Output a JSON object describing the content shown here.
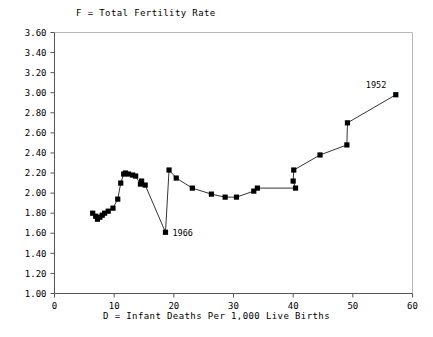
{
  "chart_data": {
    "type": "line",
    "title": "",
    "header_label": "F = Total Fertility Rate",
    "xlabel": "D = Infant Deaths Per 1,000 Live Births",
    "ylabel": "",
    "xlim": [
      0,
      60
    ],
    "ylim": [
      1.0,
      3.6
    ],
    "xticks": [
      0,
      10,
      20,
      30,
      40,
      50,
      60
    ],
    "xtick_labels": [
      "0",
      "10",
      "20",
      "30",
      "40",
      "50",
      "60"
    ],
    "yticks": [
      1.0,
      1.2,
      1.4,
      1.6,
      1.8,
      2.0,
      2.2,
      2.4,
      2.6,
      2.8,
      3.0,
      3.2,
      3.4,
      3.6
    ],
    "ytick_labels": [
      "1.00",
      "1.20",
      "1.40",
      "1.60",
      "1.80",
      "2.00",
      "2.20",
      "2.40",
      "2.60",
      "2.80",
      "3.00",
      "3.20",
      "3.40",
      "3.60"
    ],
    "grid": false,
    "legend": "none",
    "marker": "square",
    "marker_color": "#000000",
    "line_color": "#000000",
    "series": [
      {
        "name": "D vs F trajectory",
        "points": [
          [
            57.2,
            2.98
          ],
          [
            49.1,
            2.7
          ],
          [
            49.0,
            2.48
          ],
          [
            44.5,
            2.38
          ],
          [
            40.1,
            2.23
          ],
          [
            40.0,
            2.12
          ],
          [
            40.4,
            2.05
          ],
          [
            34.0,
            2.05
          ],
          [
            33.4,
            2.02
          ],
          [
            30.5,
            1.96
          ],
          [
            28.6,
            1.96
          ],
          [
            26.3,
            1.99
          ],
          [
            23.1,
            2.05
          ],
          [
            20.4,
            2.15
          ],
          [
            19.2,
            2.23
          ],
          [
            18.6,
            1.61
          ],
          [
            15.2,
            2.08
          ],
          [
            14.6,
            2.12
          ],
          [
            14.4,
            2.09
          ],
          [
            13.6,
            2.17
          ],
          [
            13.1,
            2.18
          ],
          [
            12.4,
            2.19
          ],
          [
            11.9,
            2.2
          ],
          [
            11.6,
            2.19
          ],
          [
            11.1,
            2.1
          ],
          [
            10.6,
            1.94
          ],
          [
            9.8,
            1.85
          ],
          [
            9.0,
            1.82
          ],
          [
            8.4,
            1.8
          ],
          [
            8.0,
            1.78
          ],
          [
            7.6,
            1.76
          ],
          [
            7.2,
            1.74
          ],
          [
            6.9,
            1.77
          ],
          [
            6.4,
            1.8
          ]
        ]
      }
    ],
    "annotations": [
      {
        "label": "1952",
        "x": 57.2,
        "y": 2.98,
        "dx": -30,
        "dy": -7
      },
      {
        "label": "1966",
        "x": 18.6,
        "y": 1.61,
        "dx": 7,
        "dy": 3.5
      }
    ]
  }
}
